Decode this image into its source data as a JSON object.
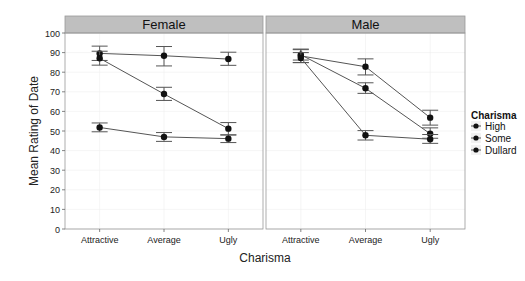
{
  "chart_data": {
    "type": "line",
    "title": "",
    "xlabel": "Charisma",
    "ylabel": "Mean Rating of Date",
    "ylim": [
      0,
      100
    ],
    "yticks": [
      0,
      10,
      20,
      30,
      40,
      50,
      60,
      70,
      80,
      90,
      100
    ],
    "ytick_labels": [
      "0",
      "10",
      "20",
      "30",
      "40",
      "50",
      "60",
      "70",
      "80",
      "90",
      "100"
    ],
    "categories": [
      "Attractive",
      "Average",
      "Ugly"
    ],
    "grid": true,
    "legend": {
      "title": "Charisma",
      "placement": "right",
      "entries": [
        "High",
        "Some",
        "Dullard"
      ]
    },
    "panels": [
      {
        "label": "Female",
        "series": [
          {
            "name": "High",
            "values": [
              89.6,
              88.4,
              86.7
            ],
            "err_low": [
              86.0,
              83.2,
              83.5
            ],
            "err_high": [
              93.3,
              93.1,
              90.2
            ]
          },
          {
            "name": "Some",
            "values": [
              87.1,
              68.9,
              51.2
            ],
            "err_low": [
              83.6,
              65.6,
              48.0
            ],
            "err_high": [
              90.7,
              72.3,
              54.3
            ]
          },
          {
            "name": "Dullard",
            "values": [
              51.8,
              47.0,
              46.1
            ],
            "err_low": [
              49.6,
              44.7,
              44.1
            ],
            "err_high": [
              54.1,
              49.2,
              48.0
            ]
          }
        ]
      },
      {
        "label": "Male",
        "series": [
          {
            "name": "High",
            "values": [
              88.3,
              82.8,
              56.8
            ],
            "err_low": [
              84.9,
              78.6,
              53.0
            ],
            "err_high": [
              91.5,
              86.8,
              60.6
            ]
          },
          {
            "name": "Some",
            "values": [
              88.9,
              71.8,
              48.6
            ],
            "err_low": [
              86.2,
              69.2,
              46.3
            ],
            "err_high": [
              91.8,
              74.6,
              51.6
            ]
          },
          {
            "name": "Dullard",
            "values": [
              87.3,
              47.8,
              45.8
            ],
            "err_low": [
              84.9,
              45.4,
              43.7
            ],
            "err_high": [
              90.0,
              50.2,
              48.2
            ]
          }
        ]
      }
    ]
  },
  "colors": {
    "strip_fill": "#bfbfbf",
    "panel_border": "#9a9a9a",
    "grid": "#eeeeee",
    "line": "#555555",
    "point": "#111111",
    "errorbar": "#555555"
  }
}
